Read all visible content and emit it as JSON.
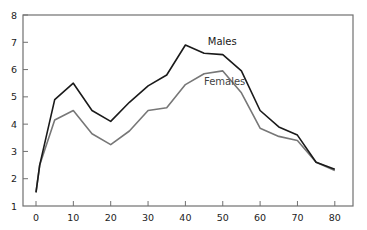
{
  "chart_data": {
    "type": "line",
    "title": "",
    "xlabel": "",
    "ylabel": "",
    "xlim": [
      -3.5,
      85
    ],
    "ylim": [
      1,
      8
    ],
    "x_ticks": [
      0,
      10,
      20,
      30,
      40,
      50,
      60,
      70,
      80
    ],
    "y_ticks": [
      1,
      2,
      3,
      4,
      5,
      6,
      7,
      8
    ],
    "grid": false,
    "legend": "inline labels",
    "x": [
      0,
      1,
      5,
      10,
      15,
      20,
      25,
      30,
      35,
      40,
      45,
      50,
      55,
      60,
      65,
      70,
      75,
      80
    ],
    "series": [
      {
        "name": "Males",
        "color": "#1a1a1a",
        "values": [
          1.5,
          2.5,
          4.9,
          5.5,
          4.5,
          4.1,
          4.8,
          5.4,
          5.8,
          6.9,
          6.6,
          6.55,
          5.95,
          4.5,
          3.9,
          3.6,
          2.6,
          2.35
        ],
        "label_pos": [
          46,
          7.0
        ]
      },
      {
        "name": "Females",
        "color": "#777777",
        "values": [
          1.5,
          2.5,
          4.15,
          4.5,
          3.65,
          3.25,
          3.75,
          4.5,
          4.6,
          5.45,
          5.85,
          5.95,
          5.15,
          3.85,
          3.55,
          3.4,
          2.6,
          2.3
        ],
        "label_pos": [
          45.5,
          5.55
        ]
      }
    ]
  },
  "labels": {
    "males": "Males",
    "females": "Females"
  }
}
